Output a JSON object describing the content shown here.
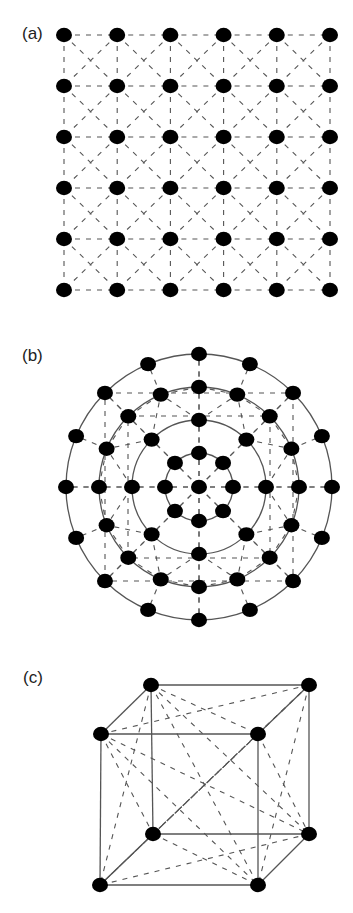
{
  "panels": [
    {
      "id": "a",
      "label": "(a)",
      "type": "square-lattice",
      "rows": 6,
      "cols": 6,
      "x0": 64,
      "y0": 35,
      "dx": 53.2,
      "dy": 51,
      "edges": "dashed nearest-neighbour lines plus dashed diagonals in every cell"
    },
    {
      "id": "b",
      "label": "(b)",
      "type": "concentric-rings",
      "center": [
        199,
        487
      ],
      "rings": [
        {
          "radius": 34,
          "count": 8,
          "circle": true
        },
        {
          "radius": 67,
          "count": 8,
          "circle": true
        },
        {
          "radius": 100,
          "count": 16,
          "circle": true
        },
        {
          "radius": 133,
          "count": 16,
          "circle": true
        }
      ],
      "center_node": true
    },
    {
      "id": "c",
      "label": "(c)",
      "type": "cube",
      "vertices": [
        [
          151,
          685
        ],
        [
          309,
          685
        ],
        [
          101,
          734
        ],
        [
          258,
          734
        ],
        [
          153,
          834
        ],
        [
          309,
          834
        ],
        [
          100,
          885
        ],
        [
          258,
          885
        ]
      ],
      "edges": [
        [
          0,
          1
        ],
        [
          0,
          2
        ],
        [
          1,
          3
        ],
        [
          2,
          3
        ],
        [
          4,
          5
        ],
        [
          4,
          6
        ],
        [
          5,
          7
        ],
        [
          6,
          7
        ],
        [
          0,
          4
        ],
        [
          1,
          5
        ],
        [
          2,
          6
        ],
        [
          3,
          7
        ]
      ],
      "dashed": "all remaining vertex pairs"
    }
  ],
  "labels": {
    "a": "(a)",
    "b": "(b)",
    "c": "(c)"
  },
  "colors": {
    "node": "#000000",
    "line": "#555555",
    "label": "#222222"
  }
}
